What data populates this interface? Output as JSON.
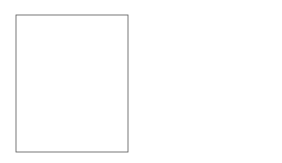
{
  "diagram": {
    "sets": [
      {
        "name": "L",
        "label": "L"
      },
      {
        "name": "M",
        "label": "M"
      }
    ],
    "inner_sets": [
      "inner-L",
      "inner-M"
    ],
    "points": [
      {
        "id": "gamma_m",
        "label": "γ(m)"
      },
      {
        "id": "l",
        "label": "l"
      },
      {
        "id": "m",
        "label": "m"
      },
      {
        "id": "alpha_l",
        "label": "α(l)"
      }
    ],
    "maps": [
      {
        "id": "gamma",
        "label": "γ",
        "style": "dotted"
      },
      {
        "id": "alpha",
        "label": "α",
        "style": "solid"
      }
    ],
    "colors": {
      "stroke": "#222222",
      "dotted": "#aaaaaa",
      "background": "#ffffff"
    }
  }
}
